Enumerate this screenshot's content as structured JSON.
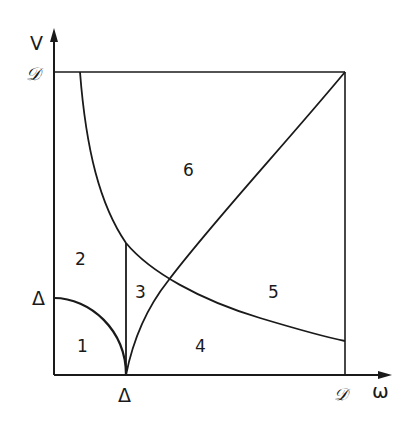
{
  "axes": {
    "y_label": "V",
    "x_label": "ω",
    "y_ticks": [
      {
        "label": "𝒟",
        "position": "top"
      },
      {
        "label": "Δ",
        "position": "delta"
      }
    ],
    "x_ticks": [
      {
        "label": "Δ",
        "position": "delta"
      },
      {
        "label": "𝒟",
        "position": "right"
      }
    ]
  },
  "regions": [
    {
      "id": "1",
      "label": "1"
    },
    {
      "id": "2",
      "label": "2"
    },
    {
      "id": "3",
      "label": "3"
    },
    {
      "id": "4",
      "label": "4"
    },
    {
      "id": "5",
      "label": "5"
    },
    {
      "id": "6",
      "label": "6"
    }
  ],
  "colors": {
    "ink": "#1a1a1a",
    "background": "#ffffff"
  }
}
